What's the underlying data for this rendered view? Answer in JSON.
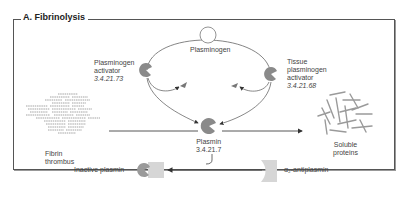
{
  "title": "A. Fibrinolysis",
  "nodes": {
    "plasminogen": {
      "label": "Plasminogen"
    },
    "plasminogen_activator": {
      "label_line1": "Plasminogen",
      "label_line2": "activator",
      "ec": "3.4.21.73"
    },
    "tissue_plasminogen_activator": {
      "label_line1": "Tissue",
      "label_line2": "plasminogen",
      "label_line3": "activator",
      "ec": "3.4.21.68"
    },
    "plasmin": {
      "label": "Plasmin",
      "ec": "3.4.21.7"
    },
    "fibrin_thrombus": {
      "label_line1": "Fibrin",
      "label_line2": "thrombus"
    },
    "soluble_proteins": {
      "label_line1": "Soluble",
      "label_line2": "proteins"
    },
    "inactive_plasmin": {
      "label": "Inactive plasmin"
    },
    "alpha2_antiplasmin": {
      "label": "α₂-antiplasmin"
    }
  },
  "colors": {
    "enzyme": "#8a8a8a",
    "inhibitor": "#d6d6d6",
    "line": "#444444",
    "frame": "#555555"
  }
}
